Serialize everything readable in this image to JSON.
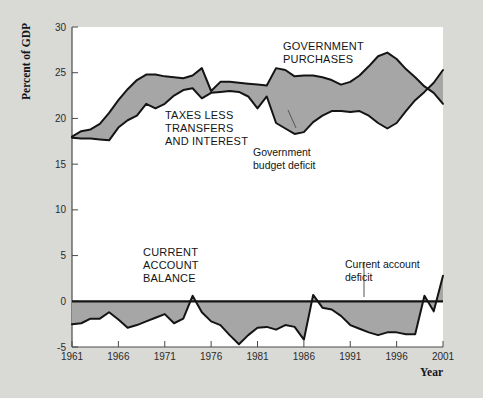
{
  "figure": {
    "background_color": "#d9d9d6",
    "plot_background_color": "#ffffff",
    "fill_color": "#a6a6a6",
    "line_color": "#141414"
  },
  "chart_data": {
    "type": "line",
    "title": "",
    "xlabel": "Year",
    "ylabel": "Percent of GDP",
    "xlim": [
      1961,
      2001
    ],
    "ylim": [
      -5,
      30
    ],
    "yticks": [
      -5,
      0,
      5,
      10,
      15,
      20,
      25,
      30
    ],
    "ytick_labels": [
      "-5",
      "0",
      "5",
      "10",
      "15",
      "20",
      "25",
      "30"
    ],
    "xticks": [
      1961,
      1966,
      1971,
      1976,
      1981,
      1986,
      1991,
      1996,
      2001
    ],
    "xtick_labels": [
      "1961",
      "1966",
      "1971",
      "1976",
      "1981",
      "1986",
      "1991",
      "1996",
      "2001"
    ],
    "grid": false,
    "legend": "inline-annotations",
    "x": [
      1961,
      1962,
      1963,
      1964,
      1965,
      1966,
      1967,
      1968,
      1969,
      1970,
      1971,
      1972,
      1973,
      1974,
      1975,
      1976,
      1977,
      1978,
      1979,
      1980,
      1981,
      1982,
      1983,
      1984,
      1985,
      1986,
      1987,
      1988,
      1989,
      1990,
      1991,
      1992,
      1993,
      1994,
      1995,
      1996,
      1997,
      1998,
      1999,
      2000,
      2001
    ],
    "series": [
      {
        "name": "GOVERNMENT PURCHASES",
        "values": [
          18.0,
          18.6,
          18.8,
          19.4,
          20.6,
          22.0,
          23.2,
          24.2,
          24.8,
          24.8,
          24.6,
          24.5,
          24.4,
          24.7,
          25.5,
          23.0,
          24.0,
          24.0,
          23.9,
          23.8,
          23.7,
          23.6,
          25.5,
          25.3,
          24.6,
          24.7,
          24.7,
          24.5,
          24.2,
          23.7,
          24.0,
          24.7,
          25.7,
          26.8,
          27.2,
          26.5,
          25.4,
          24.5,
          23.5,
          22.8,
          21.6
        ]
      },
      {
        "name": "TAXES LESS TRANSFERS AND INTEREST",
        "values": [
          17.9,
          17.8,
          17.8,
          17.7,
          17.6,
          19.0,
          19.8,
          20.3,
          21.6,
          21.1,
          21.6,
          22.5,
          23.1,
          23.3,
          22.2,
          22.8,
          22.9,
          23.0,
          22.9,
          22.4,
          21.1,
          22.4,
          19.5,
          18.9,
          18.3,
          18.5,
          19.6,
          20.3,
          20.8,
          20.8,
          20.7,
          20.8,
          20.3,
          19.5,
          18.9,
          19.5,
          20.8,
          22.0,
          22.9,
          23.9,
          25.3
        ]
      },
      {
        "name": "CURRENT ACCOUNT BALANCE",
        "values": [
          -2.5,
          -2.4,
          -1.9,
          -1.9,
          -1.2,
          -2.0,
          -2.9,
          -2.6,
          -2.2,
          -1.8,
          -1.4,
          -2.4,
          -1.9,
          0.6,
          -1.2,
          -2.2,
          -2.6,
          -3.7,
          -4.7,
          -3.7,
          -2.9,
          -2.8,
          -3.1,
          -2.6,
          -2.8,
          -4.2,
          0.7,
          -0.7,
          -0.9,
          -1.6,
          -2.6,
          -3.0,
          -3.4,
          -3.7,
          -3.4,
          -3.4,
          -3.6,
          -3.6,
          0.6,
          -1.1,
          2.8
        ]
      }
    ],
    "annotations": [
      {
        "text": "GOVERNMENT PURCHASES",
        "style": "series-label"
      },
      {
        "text": "TAXES LESS TRANSFERS AND INTEREST",
        "style": "series-label"
      },
      {
        "text": "CURRENT ACCOUNT BALANCE",
        "style": "series-label"
      },
      {
        "text": "Government budget deficit",
        "style": "callout-label"
      },
      {
        "text": "Current account deficit",
        "style": "callout-label"
      }
    ]
  },
  "labels": {
    "y_axis_title": "Percent of GDP",
    "x_axis_title": "Year",
    "government_purchases_line1": "GOVERNMENT",
    "government_purchases_line2": "PURCHASES",
    "taxes_line1": "TAXES LESS",
    "taxes_line2": "TRANSFERS",
    "taxes_line3": "AND INTEREST",
    "current_account_line1": "CURRENT",
    "current_account_line2": "ACCOUNT",
    "current_account_line3": "BALANCE",
    "budget_deficit_line1": "Government",
    "budget_deficit_line2": "budget deficit",
    "ca_deficit_line1": "Current account",
    "ca_deficit_line2": "deficit",
    "ytick_0": "30",
    "ytick_1": "25",
    "ytick_2": "20",
    "ytick_3": "15",
    "ytick_4": "10",
    "ytick_5": "5",
    "ytick_6": "0",
    "ytick_7": "-5",
    "xtick_0": "1961",
    "xtick_1": "1966",
    "xtick_2": "1971",
    "xtick_3": "1976",
    "xtick_4": "1981",
    "xtick_5": "1986",
    "xtick_6": "1991",
    "xtick_7": "1996",
    "xtick_8": "2001"
  }
}
